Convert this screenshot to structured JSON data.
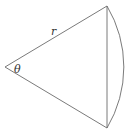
{
  "diagram": {
    "type": "circular-sector",
    "labels": {
      "radius": "r",
      "angle": "θ"
    },
    "colors": {
      "stroke": "#6b6b6b",
      "text": "#333333",
      "background": "#ffffff"
    },
    "elements": [
      "radius-top",
      "radius-bottom",
      "chord",
      "arc"
    ]
  }
}
